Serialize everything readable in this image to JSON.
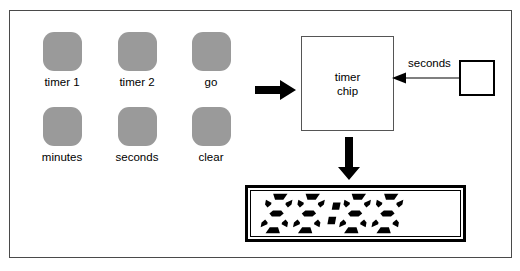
{
  "diagram": {
    "frame": {
      "name": "enclosure-frame"
    },
    "keypad": {
      "name": "keypad",
      "buttons": [
        {
          "id": "timer-1",
          "label": "timer 1",
          "x": 42,
          "y": 31,
          "shape": "rounded-square",
          "color": "#9a9a9a"
        },
        {
          "id": "timer-2",
          "label": "timer 2",
          "x": 117,
          "y": 31,
          "shape": "rounded-square",
          "color": "#9a9a9a"
        },
        {
          "id": "go",
          "label": "go",
          "x": 191,
          "y": 31,
          "shape": "rounded-square",
          "color": "#9a9a9a"
        },
        {
          "id": "minutes",
          "label": "minutes",
          "x": 42,
          "y": 106,
          "shape": "rounded-square",
          "color": "#9a9a9a"
        },
        {
          "id": "seconds",
          "label": "seconds",
          "x": 117,
          "y": 106,
          "shape": "rounded-square",
          "color": "#9a9a9a"
        },
        {
          "id": "clear",
          "label": "clear",
          "x": 191,
          "y": 106,
          "shape": "rounded-square",
          "color": "#9a9a9a"
        }
      ]
    },
    "chip": {
      "name": "timer-chip",
      "label_line_1": "timer",
      "label_line_2": "chip"
    },
    "source": {
      "name": "seconds-source",
      "label": "seconds"
    },
    "arrows": [
      {
        "id": "keypad-to-chip",
        "direction": "right",
        "style": "thick-black"
      },
      {
        "id": "chip-to-display",
        "direction": "down",
        "style": "thick-black"
      },
      {
        "id": "source-to-chip",
        "direction": "left",
        "style": "thin-black",
        "label": "seconds"
      }
    ],
    "display": {
      "name": "seven-segment-display",
      "value": "88:88",
      "digits": [
        "8",
        "8",
        "8",
        "8"
      ],
      "separator": ":",
      "segment_color": "#000000",
      "background_color": "#ffffff",
      "style": "italic-seven-segment"
    },
    "colors": {
      "button_gray": "#9a9a9a",
      "frame_border": "#4a4a4a",
      "ink": "#000000",
      "paper": "#ffffff"
    }
  }
}
